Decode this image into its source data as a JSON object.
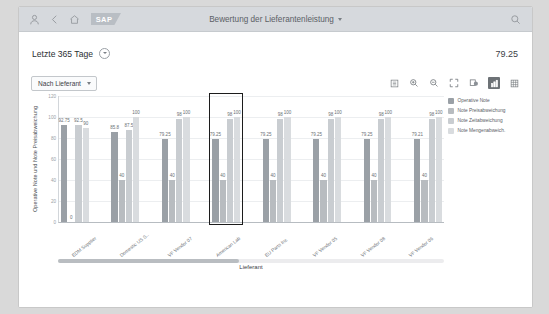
{
  "shellbar": {
    "user_icon": "person-icon",
    "back_icon": "back-chevron-icon",
    "home_icon": "home-icon",
    "logo_text": "SAP",
    "title": "Bewertung der Lieferantenleistung",
    "search_icon": "search-icon"
  },
  "kpi": {
    "period_label": "Letzte 365 Tage",
    "value": "79.25"
  },
  "toolbar": {
    "dropdown_label": "Nach Lieferant",
    "icons": [
      "legend-list-icon",
      "zoom-in-icon",
      "zoom-out-icon",
      "fullscreen-icon",
      "drilldown-icon",
      "bar-chart-icon",
      "table-view-icon"
    ],
    "active_icon": "bar-chart-icon"
  },
  "legend": {
    "items": [
      {
        "label": "Operative Note",
        "color": "#9aa0a6"
      },
      {
        "label": "Note Preisabweichung",
        "color": "#b8bcc0"
      },
      {
        "label": "Note Zeitabweichung",
        "color": "#c9cdd1"
      },
      {
        "label": "Note Mengenabweich.",
        "color": "#d9dcdf"
      }
    ]
  },
  "chart_data": {
    "type": "bar",
    "title": "",
    "xlabel": "Lieferant",
    "ylabel": "Operative Note und Note Preisabweichung",
    "ylim": [
      0,
      120
    ],
    "yticks": [
      "120",
      "100",
      "80",
      "60",
      "40",
      "20",
      "0"
    ],
    "grid": true,
    "legend_position": "right",
    "categories": [
      "EDM Supplier",
      "Domestic US S..",
      "VF Vendor 07",
      "American Lab",
      "EU Parts Inc",
      "VF Vendor 05",
      "VF Vendor 08",
      "VF Vendor 06"
    ],
    "series": [
      {
        "name": "Operative Note",
        "color": "#9aa0a6",
        "values": [
          92.75,
          85.8,
          79.25,
          79.25,
          79.25,
          79.25,
          79.25,
          79.21
        ]
      },
      {
        "name": "Note Preisabweichung",
        "color": "#b8bcc0",
        "values": [
          0,
          40,
          40,
          40,
          40,
          40,
          40,
          40
        ]
      },
      {
        "name": "Note Zeitabweichung",
        "color": "#c9cdd1",
        "values": [
          92.5,
          87.5,
          98,
          98,
          98,
          98,
          98,
          98
        ]
      },
      {
        "name": "Note Mengenabweich.",
        "color": "#d9dcdf",
        "values": [
          90,
          100,
          100,
          100,
          100,
          100,
          100,
          100
        ]
      }
    ],
    "bar_labels": [
      [
        "92.75",
        "0",
        "92.5",
        "90"
      ],
      [
        "85.8",
        "40",
        "87.5",
        "100"
      ],
      [
        "79.25",
        "40",
        "98",
        "100"
      ],
      [
        "79.25",
        "40",
        "98",
        "100"
      ],
      [
        "79.25",
        "40",
        "98",
        "100"
      ],
      [
        "79.25",
        "40",
        "98",
        "100"
      ],
      [
        "79.25",
        "40",
        "98",
        "100"
      ],
      [
        "79.21",
        "40",
        "98",
        "100"
      ]
    ],
    "selected_category_index": 3
  }
}
